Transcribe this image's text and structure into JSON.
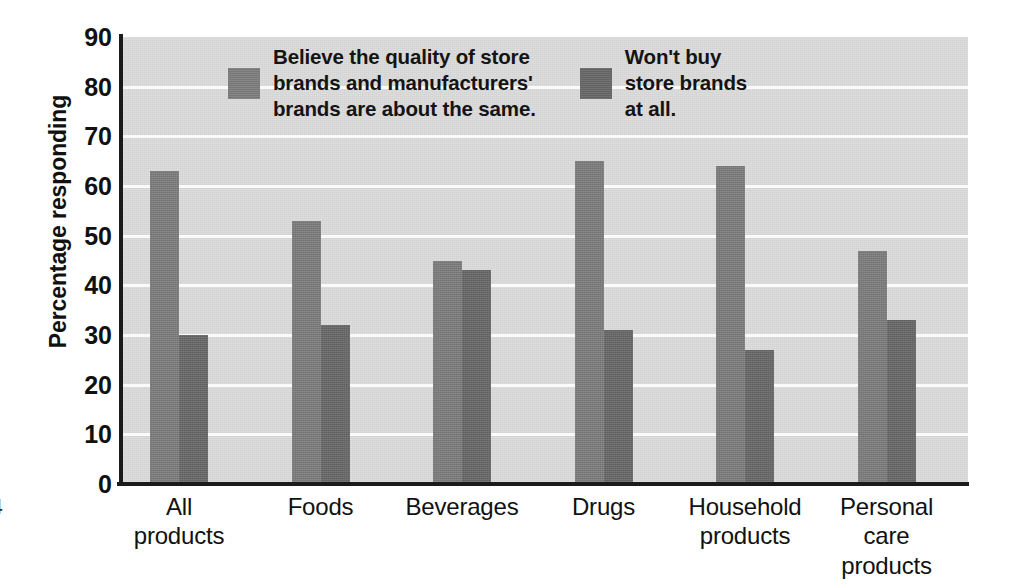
{
  "chart_data": {
    "type": "bar",
    "title": "",
    "subtitle": "",
    "xlabel": "",
    "ylabel": "Percentage responding",
    "ylim": [
      0,
      90
    ],
    "ytick_step": 10,
    "yticks": [
      90,
      80,
      70,
      60,
      50,
      40,
      30,
      20,
      10,
      0
    ],
    "grid": true,
    "grid_axis": "y",
    "legend_position": "top-center-inside",
    "categories": [
      "All\nproducts",
      "Foods",
      "Beverages",
      "Drugs",
      "Household\nproducts",
      "Personal\ncare\nproducts"
    ],
    "series": [
      {
        "name": "Believe the quality of store\nbrands and manufacturers'\nbrands are about the same.",
        "color": "#7e7e7e",
        "values": [
          63,
          53,
          45,
          65,
          64,
          47
        ]
      },
      {
        "name": "Won't buy\nstore brands\nat all.",
        "color": "#696969",
        "values": [
          30,
          32,
          43,
          31,
          27,
          33
        ]
      }
    ]
  },
  "style": {
    "plot_background": "#dcdcdc",
    "gridline_color": "#fafafa",
    "axis_color": "#1b1b1b",
    "text_color": "#111111",
    "page_background": "#ffffff"
  },
  "artifacts": {
    "page_number": "4"
  }
}
